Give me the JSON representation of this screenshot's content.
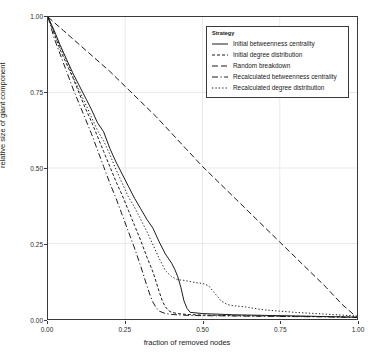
{
  "chart_data": {
    "type": "line",
    "title": "",
    "xlabel": "fraction of removed nodes",
    "ylabel": "relative size of giant component",
    "xlim": [
      0.0,
      1.0
    ],
    "ylim": [
      0.0,
      1.0
    ],
    "xticks": [
      "0.00",
      "0.25",
      "0.50",
      "0.75",
      "1.00"
    ],
    "xtick_values": [
      0.0,
      0.25,
      0.5,
      0.75,
      1.0
    ],
    "yticks": [
      "0.00",
      "0.25",
      "0.50",
      "0.75",
      "1.00"
    ],
    "ytick_values": [
      0.0,
      0.25,
      0.5,
      0.75,
      1.0
    ],
    "grid": true,
    "legend_title": "Strategy",
    "legend_position": "top-right-inside",
    "series": [
      {
        "name": "Initial betweenness centrality",
        "style": "solid",
        "x": [
          0.0,
          0.02,
          0.04,
          0.06,
          0.08,
          0.1,
          0.12,
          0.14,
          0.16,
          0.18,
          0.2,
          0.22,
          0.24,
          0.26,
          0.28,
          0.3,
          0.32,
          0.34,
          0.36,
          0.38,
          0.4,
          0.41,
          0.42,
          0.43,
          0.44,
          0.45,
          0.46,
          0.5,
          0.6,
          0.7,
          0.8,
          0.9,
          1.0
        ],
        "y": [
          1.0,
          0.955,
          0.905,
          0.86,
          0.815,
          0.775,
          0.735,
          0.695,
          0.65,
          0.62,
          0.565,
          0.52,
          0.48,
          0.44,
          0.4,
          0.365,
          0.33,
          0.3,
          0.255,
          0.215,
          0.185,
          0.165,
          0.14,
          0.105,
          0.06,
          0.035,
          0.022,
          0.018,
          0.014,
          0.012,
          0.01,
          0.008,
          0.006
        ]
      },
      {
        "name": "Initial degree distribution",
        "style": "dashed-short",
        "x": [
          0.0,
          0.02,
          0.04,
          0.06,
          0.08,
          0.1,
          0.12,
          0.14,
          0.16,
          0.18,
          0.2,
          0.22,
          0.24,
          0.26,
          0.28,
          0.3,
          0.32,
          0.34,
          0.36,
          0.37,
          0.38,
          0.39,
          0.4,
          0.42,
          0.45,
          0.5,
          0.6,
          0.7,
          0.8,
          0.9,
          1.0
        ],
        "y": [
          1.0,
          0.945,
          0.89,
          0.845,
          0.8,
          0.75,
          0.7,
          0.655,
          0.605,
          0.555,
          0.505,
          0.455,
          0.41,
          0.36,
          0.31,
          0.26,
          0.205,
          0.155,
          0.09,
          0.06,
          0.04,
          0.028,
          0.022,
          0.018,
          0.015,
          0.013,
          0.011,
          0.01,
          0.009,
          0.008,
          0.006
        ]
      },
      {
        "name": "Random breakdown",
        "style": "dashed-medium",
        "x": [
          0.0,
          0.05,
          0.1,
          0.15,
          0.2,
          0.25,
          0.3,
          0.35,
          0.4,
          0.45,
          0.5,
          0.55,
          0.6,
          0.65,
          0.7,
          0.75,
          0.8,
          0.85,
          0.9,
          0.95,
          1.0
        ],
        "y": [
          1.0,
          0.955,
          0.91,
          0.865,
          0.82,
          0.77,
          0.72,
          0.67,
          0.615,
          0.56,
          0.505,
          0.455,
          0.405,
          0.355,
          0.305,
          0.255,
          0.205,
          0.155,
          0.105,
          0.05,
          0.005
        ]
      },
      {
        "name": "Recalculated betweenness centrality",
        "style": "dash-dot",
        "x": [
          0.0,
          0.02,
          0.04,
          0.06,
          0.08,
          0.1,
          0.12,
          0.14,
          0.16,
          0.18,
          0.2,
          0.22,
          0.24,
          0.26,
          0.28,
          0.3,
          0.32,
          0.33,
          0.34,
          0.35,
          0.36,
          0.38,
          0.4,
          0.45,
          0.5,
          0.6,
          0.7,
          0.8,
          0.9,
          1.0
        ],
        "y": [
          1.0,
          0.93,
          0.875,
          0.82,
          0.765,
          0.715,
          0.665,
          0.615,
          0.56,
          0.505,
          0.45,
          0.4,
          0.345,
          0.29,
          0.235,
          0.175,
          0.11,
          0.08,
          0.055,
          0.038,
          0.026,
          0.018,
          0.015,
          0.012,
          0.011,
          0.01,
          0.009,
          0.008,
          0.007,
          0.005
        ]
      },
      {
        "name": "Recalculated degree distribution",
        "style": "dotted",
        "x": [
          0.0,
          0.02,
          0.04,
          0.06,
          0.08,
          0.1,
          0.12,
          0.14,
          0.16,
          0.18,
          0.2,
          0.22,
          0.24,
          0.26,
          0.28,
          0.3,
          0.32,
          0.34,
          0.36,
          0.38,
          0.4,
          0.42,
          0.44,
          0.45,
          0.46,
          0.48,
          0.5,
          0.52,
          0.54,
          0.56,
          0.58,
          0.6,
          0.62,
          0.64,
          0.65,
          0.7,
          0.8,
          0.9,
          1.0
        ],
        "y": [
          1.0,
          0.95,
          0.9,
          0.855,
          0.805,
          0.76,
          0.715,
          0.67,
          0.625,
          0.59,
          0.545,
          0.495,
          0.45,
          0.405,
          0.37,
          0.33,
          0.29,
          0.245,
          0.2,
          0.16,
          0.14,
          0.13,
          0.128,
          0.126,
          0.124,
          0.12,
          0.118,
          0.11,
          0.085,
          0.06,
          0.048,
          0.044,
          0.042,
          0.04,
          0.038,
          0.03,
          0.022,
          0.016,
          0.01
        ]
      }
    ]
  },
  "colors": {
    "axis": "#3a3a3a",
    "grid": "#e9e9e9",
    "line": "#1a1a1a",
    "background": "#ffffff"
  }
}
